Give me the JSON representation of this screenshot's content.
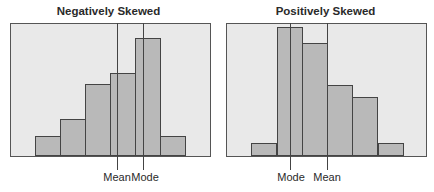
{
  "chart_data": [
    {
      "type": "bar",
      "title": "Negatively Skewed",
      "xlabel": "",
      "ylabel": "",
      "categories": [
        "1",
        "2",
        "3",
        "4",
        "5",
        "6"
      ],
      "values": [
        19,
        36,
        71,
        82,
        117,
        19
      ],
      "grid": false,
      "annotations": [
        {
          "label": "Mean",
          "position": 3.3
        },
        {
          "label": "Mode",
          "position": 4.35
        }
      ],
      "layout": {
        "plot": {
          "left": 10,
          "width": 201
        },
        "bars_left": [
          35,
          60,
          85,
          110,
          135,
          160
        ],
        "bar_width": 25,
        "lines_x": [
          117,
          143
        ]
      }
    },
    {
      "type": "bar",
      "title": "Positively Skewed",
      "xlabel": "",
      "ylabel": "",
      "categories": [
        "1",
        "2",
        "3",
        "4",
        "5",
        "6"
      ],
      "values": [
        12,
        128,
        112,
        70,
        58,
        12
      ],
      "grid": false,
      "annotations": [
        {
          "label": "Mode",
          "position": 1.5
        },
        {
          "label": "Mean",
          "position": 3.0
        }
      ],
      "layout": {
        "plot": {
          "left": 226,
          "width": 201
        },
        "bars_left": [
          251,
          277,
          302,
          327,
          352,
          378
        ],
        "bar_width": 25,
        "lines_x": [
          290,
          327
        ]
      }
    }
  ],
  "charts": {
    "left": {
      "title": "Negatively Skewed",
      "label_a": "Mean",
      "label_b": "Mode"
    },
    "right": {
      "title": "Positively Skewed",
      "label_a": "Mode",
      "label_b": "Mean"
    }
  }
}
